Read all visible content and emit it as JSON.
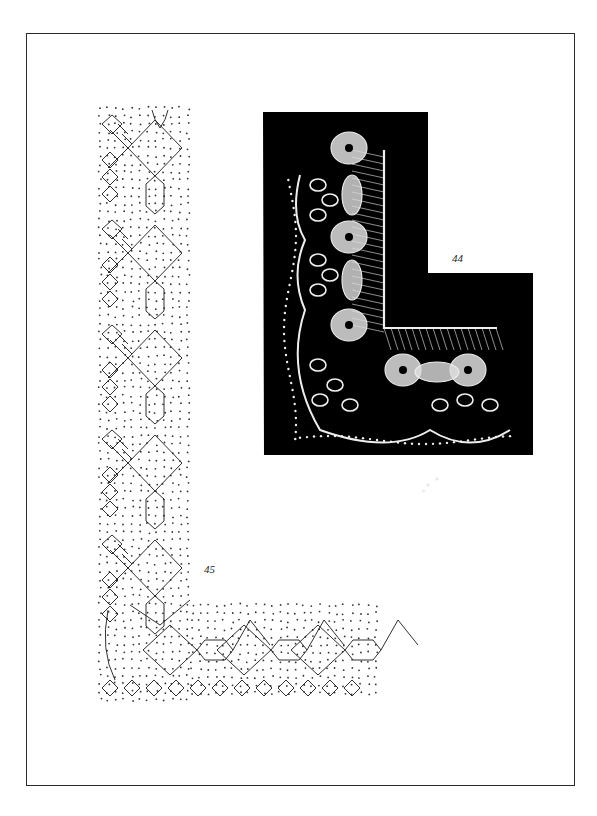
{
  "page": {
    "background": "#ffffff",
    "frame_color": "#2a2a2a"
  },
  "figures": [
    {
      "id": "44",
      "label": "44",
      "kind": "photograph",
      "description": "Photograph of a bobbin lace corner on black background",
      "background": "#000000",
      "lace_color": "#f2f2f2"
    },
    {
      "id": "45",
      "label": "45",
      "kind": "pricking-diagram",
      "description": "Pricking and working diagram for the lace corner",
      "line_color": "#1a1a1a",
      "dot_color": "#333333"
    }
  ],
  "marks": {
    "stamp": ""
  }
}
